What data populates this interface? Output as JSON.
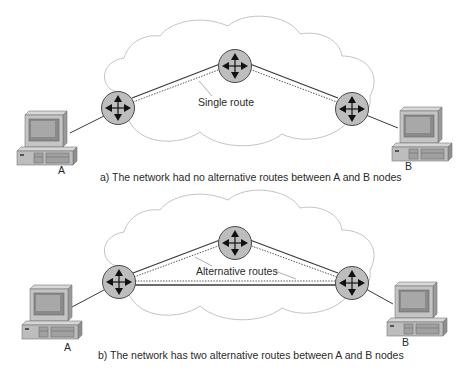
{
  "diagrams": [
    {
      "id": "a",
      "caption": "a) The network had no alternative routes between A and B nodes",
      "route_label": "Single route",
      "node_a_label": "A",
      "node_b_label": "B",
      "routes": 1
    },
    {
      "id": "b",
      "caption": "b) The network has two alternative routes between A and B nodes",
      "route_label": "Alternative routes",
      "node_a_label": "A",
      "node_b_label": "B",
      "routes": 2
    }
  ],
  "colors": {
    "cloud_stroke": "#b4b4b4",
    "router_fill": "#bcbcbc",
    "router_stroke": "#505050",
    "link": "#3a3a3a",
    "text": "#2a2a2a"
  }
}
